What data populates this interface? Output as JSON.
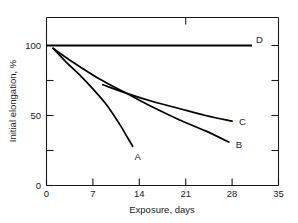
{
  "chart_data": {
    "type": "line",
    "title": "",
    "xlabel": "Exposure, days",
    "ylabel": "Initial elongation, %",
    "xlim": [
      0,
      35
    ],
    "ylim": [
      0,
      125
    ],
    "xticks": [
      0,
      7,
      14,
      21,
      28,
      35
    ],
    "xtick_labels": [
      "0",
      "7",
      "14",
      "21",
      "28",
      "35"
    ],
    "yticks": [
      0,
      50,
      100
    ],
    "ytick_labels": [
      "0",
      "50",
      "100"
    ],
    "yminor_ticks": [
      25,
      75
    ],
    "grid": false,
    "legend_position": "inline-end-labels",
    "series": [
      {
        "name": "A",
        "label": "A",
        "x": [
          1.0,
          3.0,
          5.0,
          7.0,
          9.0,
          11.0,
          12.0,
          13.0
        ],
        "y": [
          98,
          88,
          79,
          69,
          58,
          44,
          36,
          28
        ]
      },
      {
        "name": "B",
        "label": "B",
        "x": [
          1.0,
          4.0,
          8.0,
          12.0,
          16.0,
          20.0,
          24.0,
          27.5
        ],
        "y": [
          98,
          88,
          76,
          66,
          56,
          47,
          39,
          31
        ]
      },
      {
        "name": "C",
        "label": "C",
        "x": [
          8.5,
          12.0,
          16.0,
          20.0,
          24.0,
          28.0
        ],
        "y": [
          72,
          66,
          60,
          55,
          50,
          46
        ]
      },
      {
        "name": "D",
        "label": "D",
        "x": [
          0.0,
          31.0
        ],
        "y": [
          100,
          100
        ]
      }
    ]
  },
  "labels": {
    "a": "A",
    "b": "B",
    "c": "C",
    "d": "D"
  }
}
